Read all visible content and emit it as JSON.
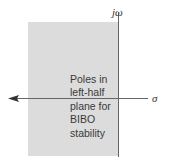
{
  "figure": {
    "axes": {
      "vertical_label": "jω",
      "horizontal_label": "σ"
    },
    "region": {
      "description": "left-half plane",
      "fill_color": "#dcdcdc"
    },
    "annotation_lines": [
      "Poles in",
      "left-half",
      "plane for",
      "BIBO",
      "stability"
    ],
    "colors": {
      "axis": "#666666",
      "text": "#3a3a3a",
      "background": "#ffffff"
    }
  }
}
